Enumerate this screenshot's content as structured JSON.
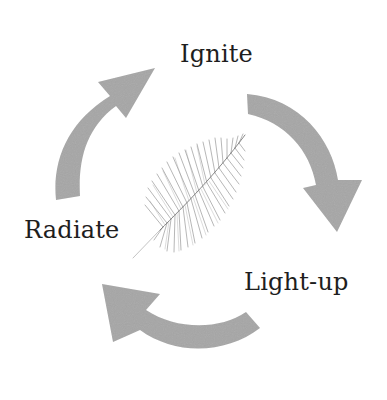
{
  "diagram": {
    "type": "cycle",
    "labels": {
      "ignite": "Ignite",
      "lightup": "Light-up",
      "radiate": "Radiate"
    },
    "cycle_order": [
      "Ignite",
      "Light-up",
      "Radiate"
    ],
    "arrow_count": 3,
    "center_image": "fern-leaf-sketch",
    "colors": {
      "arrow_fill": "#a6a6a6",
      "text": "#1e1e1e",
      "leaf_stroke": "#7a7a7a",
      "background": "#ffffff"
    }
  }
}
